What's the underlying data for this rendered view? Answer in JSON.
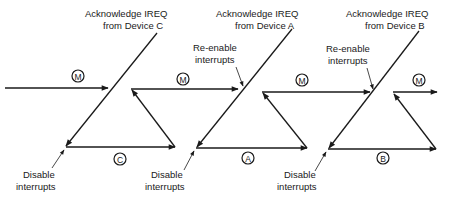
{
  "diagram": {
    "type": "interrupt-sequence-timing",
    "colors": {
      "ink": "#1a1a1a",
      "background": "#ffffff"
    },
    "acknowledge_labels": [
      {
        "line1": "Acknowledge IREQ",
        "line2": "from Device C"
      },
      {
        "line1": "Acknowledge IREQ",
        "line2": "from Device A"
      },
      {
        "line1": "Acknowledge IREQ",
        "line2": "from Device B"
      }
    ],
    "reenable_labels": [
      {
        "line1": "Re-enable",
        "line2": "interrupts"
      },
      {
        "line1": "Re-enable",
        "line2": "interrupts"
      }
    ],
    "disable_labels": [
      {
        "line1": "Disable",
        "line2": "interrupts"
      },
      {
        "line1": "Disable",
        "line2": "interrupts"
      },
      {
        "line1": "Disable",
        "line2": "interrupts"
      }
    ],
    "main_program_markers": [
      "M",
      "M",
      "M",
      "M"
    ],
    "service_routine_markers": [
      "C",
      "A",
      "B"
    ]
  }
}
